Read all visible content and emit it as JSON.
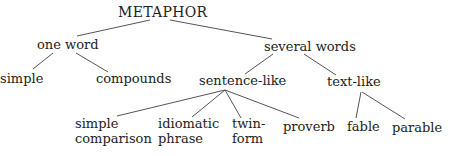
{
  "diagram": {
    "title": "METAPHOR",
    "nodes": {
      "root": "METAPHOR",
      "one_word": "one word",
      "several_words": "several words",
      "simple": "simple",
      "compounds": "compounds",
      "sentence_like": "sentence-like",
      "text_like": "text-like",
      "simple_comparison": [
        "simple",
        "comparison"
      ],
      "idiomatic_phrase": [
        "idiomatic",
        "phrase"
      ],
      "twin_form": [
        "twin-",
        "form"
      ],
      "proverb": "proverb",
      "fable": "fable",
      "parable": "parable"
    },
    "edges": [
      [
        "METAPHOR",
        "one word"
      ],
      [
        "METAPHOR",
        "several words"
      ],
      [
        "one word",
        "simple"
      ],
      [
        "one word",
        "compounds"
      ],
      [
        "several words",
        "sentence-like"
      ],
      [
        "several words",
        "text-like"
      ],
      [
        "sentence-like",
        "simple comparison"
      ],
      [
        "sentence-like",
        "idiomatic phrase"
      ],
      [
        "sentence-like",
        "twin-form"
      ],
      [
        "sentence-like",
        "proverb"
      ],
      [
        "text-like",
        "fable"
      ],
      [
        "text-like",
        "parable"
      ]
    ],
    "line_color": "#555555",
    "text_color": "#222222"
  }
}
